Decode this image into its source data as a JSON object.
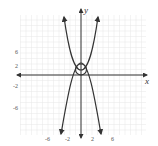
{
  "chart_data": {
    "type": "line",
    "title": "",
    "xlabel": "x",
    "ylabel": "y",
    "xlim": [
      -11,
      12
    ],
    "ylim": [
      -11,
      11
    ],
    "grid": true,
    "x_ticks": [
      -6,
      -2,
      2,
      6
    ],
    "y_ticks": [
      6,
      2,
      -2,
      -6
    ],
    "x_tick_labels": [
      "-6",
      "-2",
      "2",
      "6"
    ],
    "y_tick_labels": [
      "6",
      "2",
      "-2",
      "-6"
    ],
    "series": [
      {
        "name": "upward-parabola",
        "description": "y = x^2 branch opening upward, arrows at top",
        "points": [
          [
            -3.1,
            10.5
          ],
          [
            -2,
            4.5
          ],
          [
            -1,
            1
          ],
          [
            0,
            0
          ],
          [
            1,
            1
          ],
          [
            2,
            4.5
          ],
          [
            3.1,
            10.5
          ]
        ]
      },
      {
        "name": "downward-parabola",
        "description": "y = 2 - x^2 branch opening downward, arrows at bottom",
        "points": [
          [
            -3.6,
            -10.5
          ],
          [
            -2,
            -2.5
          ],
          [
            -1,
            1
          ],
          [
            0,
            2
          ],
          [
            1,
            1
          ],
          [
            2,
            -2.5
          ],
          [
            3.6,
            -10.5
          ]
        ]
      },
      {
        "name": "circle",
        "description": "small circle centered near (0,1) radius ~1",
        "center": [
          0,
          1
        ],
        "radius": 1
      }
    ],
    "annotations": [
      "arrowheads on both curve ends",
      "arrowheads on axes"
    ]
  },
  "axes": {
    "x_label": "x",
    "y_label": "y"
  },
  "colors": {
    "curve": "#333333",
    "grid": "#e6e6e6",
    "axis": "#333333",
    "background": "#ffffff"
  }
}
